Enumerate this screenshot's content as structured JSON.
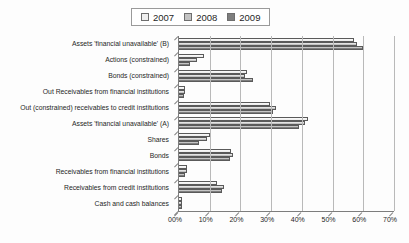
{
  "chart_data": {
    "type": "bar",
    "orientation": "horizontal",
    "title": "",
    "xlabel": "",
    "ylabel": "",
    "xlim": [
      0,
      70
    ],
    "x_tick_labels": [
      "00%",
      "10%",
      "20%",
      "30%",
      "40%",
      "50%",
      "60%",
      "70%"
    ],
    "grid": "vertical",
    "legend_position": "top-center",
    "categories": [
      "Assets 'financial unavailable' (B)",
      "Actions (constrained)",
      "Bonds (constrained)",
      "Out Receivables from financial institutions",
      "Out (constrained) receivables to credit institutions",
      "Assets 'financial unavailable' (A)",
      "Shares",
      "Bonds",
      "Receivables from financial institutions",
      "Receivables from credit institutions",
      "Cash and cash balances"
    ],
    "series": [
      {
        "name": "2007",
        "color": "#efefef",
        "values": [
          57,
          8,
          22,
          2,
          29.5,
          42,
          10,
          17,
          2.5,
          12.5,
          1
        ]
      },
      {
        "name": "2008",
        "color": "#c3c3c3",
        "values": [
          58,
          6,
          21.5,
          2,
          31.5,
          41,
          9,
          17.5,
          2.5,
          14.5,
          1
        ]
      },
      {
        "name": "2009",
        "color": "#7e7e7e",
        "values": [
          60,
          3.5,
          24,
          1.5,
          30.5,
          39,
          6.5,
          16.5,
          2,
          14,
          1
        ]
      }
    ],
    "colors": {
      "axis": "#7d7d7d",
      "gridline": "#b9b9b9",
      "bar_border": "#5a5a5a"
    }
  }
}
